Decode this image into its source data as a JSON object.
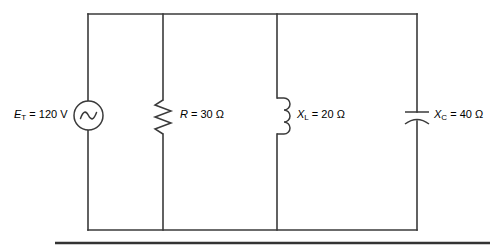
{
  "figure": {
    "type": "parallel-rlc-ac-circuit-diagram",
    "background_color": "#ffffff",
    "line_color": "#3a3a3a",
    "rule_color": "#333333"
  },
  "components": {
    "source": {
      "icon": "ac-voltage-source-icon",
      "symbol": "E",
      "subscript": "T",
      "equals": " = ",
      "value": "120",
      "unit": "V",
      "label": "E_T = 120 V"
    },
    "resistor": {
      "icon": "resistor-zigzag-icon",
      "symbol": "R",
      "subscript": "",
      "equals": " = ",
      "value": "30",
      "unit": "Ω",
      "label": "R = 30 Ω"
    },
    "inductor": {
      "icon": "inductor-coil-icon",
      "symbol": "X",
      "subscript": "L",
      "equals": " = ",
      "value": "20",
      "unit": "Ω",
      "label": "X_L = 20 Ω"
    },
    "capacitor": {
      "icon": "capacitor-curved-plate-icon",
      "symbol": "X",
      "subscript": "C",
      "equals": " = ",
      "value": "40",
      "unit": "Ω",
      "label": "X_C = 40 Ω"
    }
  },
  "rails": {
    "top_y": 14,
    "bottom_y": 230,
    "left_x": 88,
    "right_x": 417
  },
  "separator_rule": {
    "name": "horizontal-rule",
    "x1": 55,
    "x2": 490,
    "y": 243
  }
}
